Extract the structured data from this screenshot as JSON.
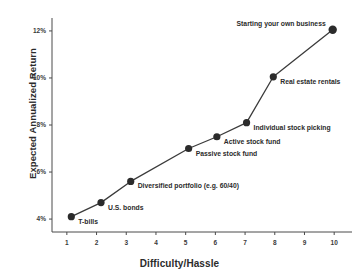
{
  "chart_data": {
    "type": "line",
    "title": "",
    "xlabel": "Difficulty/Hassle",
    "ylabel": "Expected Annualized Return",
    "xlim": [
      0.5,
      10.6
    ],
    "ylim": [
      3.45,
      12.55
    ],
    "grid": false,
    "legend": "none",
    "x_ticks": [
      "1",
      "2",
      "3",
      "4",
      "5",
      "6",
      "7",
      "8",
      "9",
      "10"
    ],
    "x_tick_values": [
      1,
      2,
      3,
      4,
      5,
      6,
      7,
      8,
      9,
      10
    ],
    "y_ticks": [
      "4%",
      "6%",
      "8%",
      "10%",
      "12%"
    ],
    "y_tick_values": [
      4,
      6,
      8,
      10,
      12
    ],
    "marker": "circle",
    "line_color": "#3b3b3b",
    "marker_color": "#2b2b2b",
    "points": [
      {
        "label": "T-bills",
        "x": 1.15,
        "y": 4.1,
        "label_side": "right"
      },
      {
        "label": "U.S. bonds",
        "x": 2.15,
        "y": 4.7,
        "label_side": "right"
      },
      {
        "label": "Diversified portfolio (e.g. 60/40)",
        "x": 3.15,
        "y": 5.6,
        "label_side": "right"
      },
      {
        "label": "Passive stock fund",
        "x": 5.1,
        "y": 7.0,
        "label_side": "right"
      },
      {
        "label": "Active stock fund",
        "x": 6.05,
        "y": 7.5,
        "label_side": "right"
      },
      {
        "label": "Individual stock picking",
        "x": 7.05,
        "y": 8.1,
        "label_side": "right"
      },
      {
        "label": "Real estate rentals",
        "x": 7.95,
        "y": 10.05,
        "label_side": "right"
      },
      {
        "label": "Starting your own business",
        "x": 9.95,
        "y": 12.05,
        "label_side": "left"
      }
    ]
  }
}
